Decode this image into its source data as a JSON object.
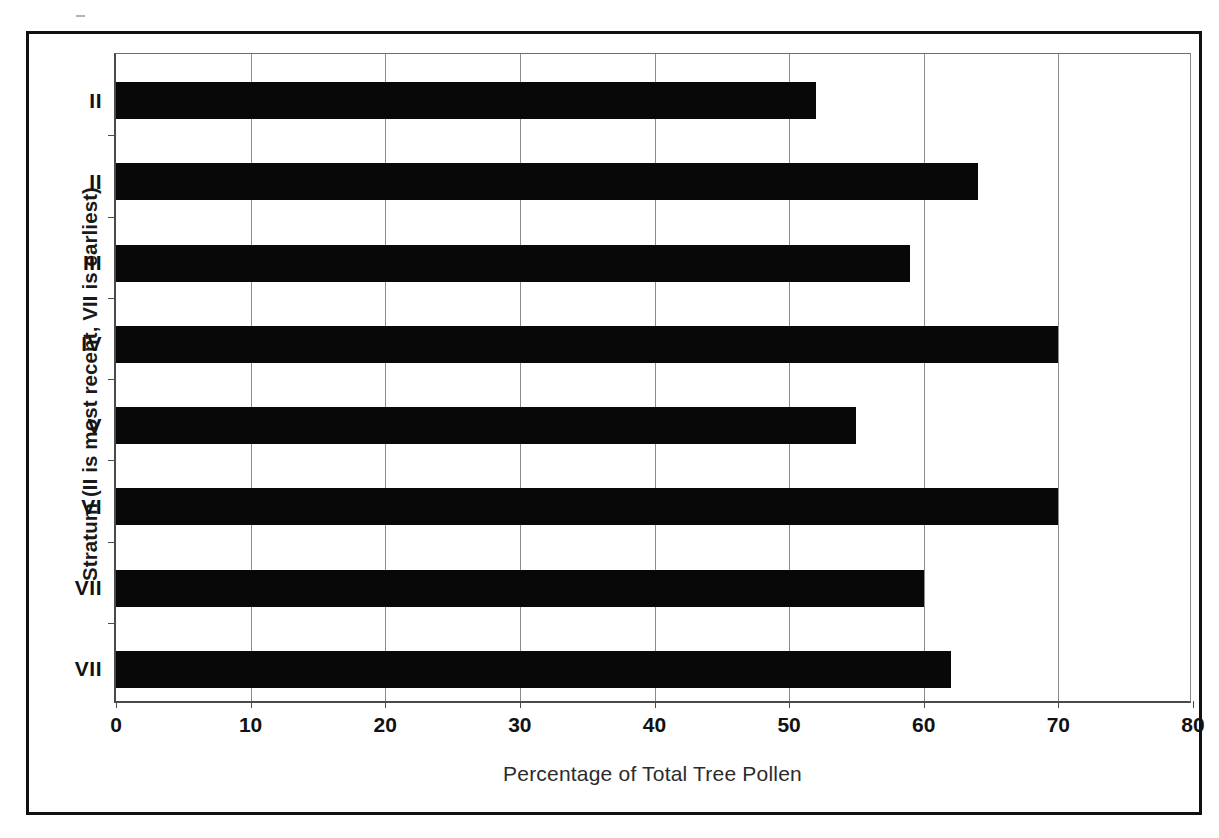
{
  "chart_data": {
    "type": "bar",
    "orientation": "horizontal",
    "title": "",
    "subtitle": "",
    "xlabel": "Percentage of Total Tree Pollen",
    "ylabel": "Stratum (II is most recent, VII is earliest)",
    "categories": [
      "II",
      "II",
      "III",
      "IV",
      "V",
      "VI",
      "VII",
      "VII"
    ],
    "values": [
      52,
      64,
      59,
      70,
      55,
      70,
      60,
      62
    ],
    "series": [
      {
        "name": "Percentage of Total Tree Pollen",
        "values": [
          52,
          64,
          59,
          70,
          55,
          70,
          60,
          62
        ]
      }
    ],
    "xlim": [
      0,
      80
    ],
    "xticks": [
      0,
      10,
      20,
      30,
      40,
      50,
      60,
      70,
      80
    ],
    "xtick_labels": [
      "0",
      "10",
      "20",
      "30",
      "40",
      "50",
      "60",
      "70",
      "80"
    ],
    "grid": true,
    "grid_axis": "x",
    "legend": false,
    "legend_position": "none",
    "bar_color": "#080808",
    "gridline_color": "#8c8c8c",
    "axis_color": "#4a4a4a",
    "background_color": "#ffffff",
    "frame_color": "#111111",
    "annotations": []
  },
  "figure": {
    "y_axis_title": "Stratum (II is most recent, VII is earliest)",
    "x_axis_title": "Percentage of Total Tree Pollen"
  }
}
